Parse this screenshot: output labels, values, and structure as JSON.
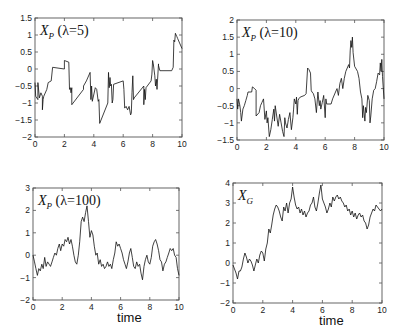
{
  "figure": {
    "width": 407,
    "height": 334,
    "line_color": "#111111",
    "axis_color": "#555555",
    "background": "#ffffff"
  },
  "chart_data": [
    {
      "type": "line",
      "id": "xp-lambda-5",
      "title": "X_P (λ=5)",
      "title_main": "X",
      "title_sub": "P",
      "title_param": " (λ=5)",
      "xlabel": "",
      "ylabel": "",
      "xlim": [
        0,
        10
      ],
      "ylim": [
        -2,
        1.5
      ],
      "xticks": [
        0,
        2,
        4,
        6,
        8,
        10
      ],
      "yticks": [
        -2,
        -1.5,
        -1,
        -0.5,
        0,
        0.5,
        1,
        1.5
      ],
      "grid": false,
      "box": {
        "x0": 35,
        "y0": 18,
        "x1": 182,
        "y1": 137
      },
      "x": [
        0,
        0.05,
        0.2,
        0.2,
        0.3,
        0.4,
        0.5,
        0.5,
        0.55,
        0.6,
        0.8,
        0.9,
        1.1,
        1.2,
        2.0,
        2.0,
        2.3,
        2.35,
        2.4,
        2.45,
        2.5,
        2.5,
        3.3,
        3.3,
        3.5,
        3.75,
        3.8,
        3.85,
        3.9,
        4.1,
        4.2,
        4.3,
        4.35,
        4.4,
        4.95,
        5.0,
        5.05,
        5.1,
        5.15,
        5.2,
        5.25,
        5.3,
        5.35,
        6.0,
        6.05,
        6.1,
        6.2,
        6.3,
        6.4,
        6.5,
        6.55,
        6.6,
        6.65,
        6.7,
        6.75,
        7.4,
        7.4,
        7.45,
        7.5,
        7.55,
        7.9,
        7.95,
        8.0,
        8.05,
        8.15,
        8.2,
        8.25,
        8.3,
        8.4,
        8.4,
        8.5,
        9.3,
        9.4,
        9.45,
        9.5,
        9.55,
        9.6,
        9.65,
        9.7,
        10.0
      ],
      "values": [
        -0.4,
        -0.8,
        -0.9,
        -0.4,
        -0.85,
        -0.7,
        -0.8,
        -1.2,
        -0.9,
        -0.8,
        -0.6,
        -0.4,
        -0.35,
        0.05,
        0.0,
        0.25,
        0.2,
        -0.6,
        -0.55,
        -0.7,
        -0.55,
        -1.05,
        -0.6,
        -0.5,
        -0.35,
        -0.1,
        -0.9,
        -0.5,
        -0.95,
        -0.55,
        -0.6,
        -0.95,
        -0.9,
        -1.6,
        -1.0,
        -0.1,
        -0.55,
        -0.25,
        -0.5,
        -0.45,
        -1.0,
        -0.9,
        -0.45,
        -0.35,
        -0.6,
        -1.15,
        -1.1,
        -1.2,
        -1.1,
        -1.35,
        -1.3,
        -0.7,
        -0.2,
        -0.9,
        -0.85,
        -0.5,
        -1.05,
        -0.6,
        -0.9,
        -0.55,
        -0.35,
        -0.15,
        0.25,
        0.15,
        -0.2,
        -0.5,
        -0.3,
        -0.6,
        0.15,
        0.1,
        -0.05,
        -0.05,
        0.05,
        0.85,
        0.8,
        1.05,
        1.0,
        0.95,
        0.9,
        0.6
      ]
    },
    {
      "type": "line",
      "id": "xp-lambda-10",
      "title": "X_P (λ=10)",
      "title_main": "X",
      "title_sub": "P",
      "title_param": " (λ=10)",
      "xlabel": "",
      "ylabel": "",
      "xlim": [
        0,
        10
      ],
      "ylim": [
        -1.5,
        2
      ],
      "xticks": [
        0,
        2,
        4,
        6,
        8,
        10
      ],
      "yticks": [
        -1.5,
        -1,
        -0.5,
        0,
        0.5,
        1,
        1.5,
        2
      ],
      "grid": false,
      "box": {
        "x0": 237,
        "y0": 20,
        "x1": 384,
        "y1": 140
      },
      "x": [
        0,
        0.05,
        0.1,
        0.2,
        0.25,
        0.3,
        0.4,
        0.5,
        0.6,
        0.7,
        0.75,
        1.0,
        1.05,
        1.2,
        1.3,
        1.3,
        1.5,
        1.6,
        1.7,
        1.8,
        1.9,
        2.0,
        2.05,
        2.1,
        2.2,
        2.3,
        2.4,
        2.5,
        2.55,
        2.6,
        2.7,
        2.8,
        2.9,
        3.0,
        3.1,
        3.2,
        3.25,
        3.3,
        3.4,
        3.5,
        3.6,
        3.7,
        3.8,
        3.85,
        3.9,
        4.0,
        4.05,
        4.1,
        4.15,
        4.2,
        4.3,
        4.6,
        4.7,
        4.8,
        4.9,
        5.0,
        5.05,
        5.1,
        5.2,
        5.3,
        5.4,
        5.5,
        5.6,
        5.65,
        5.7,
        5.8,
        5.9,
        6.0,
        6.05,
        6.1,
        6.4,
        6.5,
        6.7,
        6.8,
        6.9,
        7.0,
        7.1,
        7.2,
        7.3,
        7.4,
        7.6,
        7.65,
        7.7,
        7.75,
        7.8,
        7.85,
        7.9,
        8.0,
        8.2,
        8.3,
        8.4,
        8.5,
        8.55,
        8.6,
        8.7,
        8.75,
        8.8,
        8.9,
        9.0,
        9.05,
        9.1,
        9.2,
        9.3,
        9.4,
        9.5,
        9.6,
        9.7,
        9.75,
        9.8,
        9.85,
        9.9,
        10.0
      ],
      "values": [
        -0.3,
        -0.6,
        -0.3,
        -0.5,
        -0.7,
        -0.95,
        -0.6,
        -0.5,
        -0.35,
        -0.2,
        -0.1,
        -0.1,
        0.05,
        0.0,
        -0.05,
        -0.8,
        -0.7,
        -0.5,
        -0.4,
        -0.3,
        -0.9,
        -0.65,
        -1.0,
        -0.85,
        -1.4,
        -1.2,
        -0.9,
        -0.6,
        -0.95,
        -0.5,
        -0.8,
        -1.1,
        -0.75,
        -1.0,
        -1.25,
        -1.4,
        -0.85,
        -1.0,
        -1.15,
        -0.9,
        -0.7,
        -1.2,
        -0.85,
        -0.6,
        -0.3,
        -0.45,
        -0.25,
        -0.75,
        -0.35,
        -0.3,
        -0.25,
        -0.2,
        -0.15,
        0.6,
        0.55,
        0.45,
        -0.05,
        -0.1,
        -0.15,
        -0.3,
        -0.7,
        -0.1,
        -0.5,
        -0.35,
        -0.6,
        -0.4,
        -0.2,
        -0.85,
        -0.3,
        -0.45,
        -0.45,
        -0.3,
        -0.1,
        0.0,
        -0.2,
        0.15,
        0.3,
        0.0,
        0.3,
        0.5,
        0.7,
        0.6,
        1.1,
        1.4,
        1.2,
        1.5,
        1.05,
        0.65,
        0.5,
        0.3,
        -0.1,
        -0.3,
        -0.85,
        -0.5,
        -0.95,
        -0.55,
        -0.7,
        -0.2,
        -0.35,
        -1.0,
        -0.8,
        -0.3,
        -0.05,
        0.0,
        0.2,
        0.45,
        0.4,
        0.75,
        0.5,
        0.85,
        0.35,
        -0.3
      ]
    },
    {
      "type": "line",
      "id": "xp-lambda-100",
      "title": "X_P (λ=100)",
      "title_main": "X",
      "title_sub": "P",
      "title_param": " (λ=100)",
      "xlabel": "time",
      "ylabel": "",
      "xlim": [
        0,
        10
      ],
      "ylim": [
        -2,
        3
      ],
      "xticks": [
        0,
        2,
        4,
        6,
        8,
        10
      ],
      "yticks": [
        -2,
        -1,
        0,
        1,
        2,
        3
      ],
      "grid": false,
      "box": {
        "x0": 33,
        "y0": 188,
        "x1": 179,
        "y1": 300
      },
      "x": [
        0,
        0.1,
        0.2,
        0.3,
        0.4,
        0.5,
        0.6,
        0.7,
        0.8,
        0.9,
        1.0,
        1.1,
        1.2,
        1.3,
        1.4,
        1.5,
        1.6,
        1.7,
        1.8,
        1.9,
        2.0,
        2.1,
        2.2,
        2.3,
        2.4,
        2.5,
        2.6,
        2.7,
        2.8,
        2.9,
        3.0,
        3.1,
        3.2,
        3.3,
        3.4,
        3.5,
        3.6,
        3.7,
        3.8,
        3.9,
        4.0,
        4.1,
        4.2,
        4.3,
        4.4,
        4.5,
        4.6,
        4.7,
        4.8,
        4.9,
        5.0,
        5.1,
        5.2,
        5.3,
        5.4,
        5.5,
        5.6,
        5.7,
        5.8,
        5.9,
        6.0,
        6.1,
        6.2,
        6.3,
        6.4,
        6.5,
        6.6,
        6.7,
        6.8,
        6.9,
        7.0,
        7.1,
        7.2,
        7.3,
        7.4,
        7.5,
        7.6,
        7.7,
        7.8,
        7.9,
        8.0,
        8.1,
        8.2,
        8.3,
        8.4,
        8.5,
        8.6,
        8.7,
        8.8,
        8.9,
        9.0,
        9.1,
        9.2,
        9.3,
        9.4,
        9.5,
        9.6,
        9.7,
        9.8,
        9.9,
        10.0
      ],
      "values": [
        0.0,
        -0.3,
        -0.6,
        -0.9,
        -0.6,
        -0.7,
        -0.4,
        -0.6,
        -0.1,
        -0.5,
        -0.3,
        -0.4,
        -0.5,
        -0.3,
        -0.1,
        0.1,
        0.0,
        0.3,
        0.5,
        0.2,
        0.5,
        0.4,
        0.7,
        0.6,
        0.8,
        0.5,
        0.7,
        0.4,
        0.0,
        -0.3,
        -0.4,
        0.0,
        0.6,
        1.5,
        1.7,
        1.5,
        1.9,
        2.2,
        1.5,
        0.8,
        1.1,
        0.9,
        0.4,
        0.0,
        0.1,
        -0.4,
        -0.2,
        -0.5,
        -0.4,
        -0.6,
        -0.5,
        -0.3,
        -0.5,
        -0.4,
        -0.6,
        -0.2,
        0.1,
        0.6,
        0.4,
        0.5,
        0.3,
        0.1,
        -0.2,
        -0.4,
        -0.6,
        -0.3,
        0.1,
        0.3,
        -0.1,
        -0.5,
        -0.6,
        -0.3,
        -0.5,
        -0.4,
        -0.8,
        -1.1,
        -0.5,
        -0.2,
        0.0,
        -0.3,
        -0.4,
        -0.1,
        0.4,
        0.6,
        0.7,
        0.5,
        0.2,
        -0.2,
        -0.3,
        -0.7,
        -0.4,
        -0.3,
        -0.1,
        0.1,
        0.3,
        0.2,
        0.3,
        0.0,
        -0.1,
        -0.6,
        -0.9
      ]
    },
    {
      "type": "line",
      "id": "xg",
      "title": "X_G",
      "title_main": "X",
      "title_sub": "G",
      "title_param": "",
      "xlabel": "time",
      "ylabel": "",
      "xlim": [
        0,
        10
      ],
      "ylim": [
        -2,
        4
      ],
      "xticks": [
        0,
        2,
        4,
        6,
        8,
        10
      ],
      "yticks": [
        -2,
        -1,
        0,
        1,
        2,
        3,
        4
      ],
      "grid": false,
      "box": {
        "x0": 233,
        "y0": 183,
        "x1": 382,
        "y1": 303
      },
      "x": [
        0,
        0.1,
        0.2,
        0.3,
        0.4,
        0.5,
        0.6,
        0.7,
        0.8,
        0.9,
        1.0,
        1.1,
        1.2,
        1.3,
        1.4,
        1.5,
        1.6,
        1.7,
        1.8,
        1.9,
        2.0,
        2.1,
        2.2,
        2.3,
        2.4,
        2.5,
        2.6,
        2.7,
        2.8,
        2.9,
        3.0,
        3.1,
        3.2,
        3.3,
        3.4,
        3.5,
        3.6,
        3.7,
        3.8,
        3.9,
        4.0,
        4.1,
        4.2,
        4.3,
        4.4,
        4.5,
        4.6,
        4.7,
        4.8,
        4.9,
        5.0,
        5.1,
        5.2,
        5.3,
        5.4,
        5.5,
        5.6,
        5.7,
        5.8,
        5.9,
        6.0,
        6.1,
        6.2,
        6.3,
        6.4,
        6.5,
        6.6,
        6.7,
        6.8,
        6.9,
        7.0,
        7.1,
        7.2,
        7.3,
        7.4,
        7.5,
        7.6,
        7.7,
        7.8,
        7.9,
        8.0,
        8.1,
        8.2,
        8.3,
        8.4,
        8.5,
        8.6,
        8.7,
        8.8,
        8.9,
        9.0,
        9.1,
        9.2,
        9.3,
        9.4,
        9.5,
        9.6,
        9.7,
        9.8,
        9.9,
        10.0
      ],
      "values": [
        -0.1,
        -0.3,
        -0.5,
        -0.8,
        -0.4,
        -0.4,
        -0.2,
        0.2,
        0.5,
        0.3,
        0.0,
        0.2,
        0.1,
        -0.1,
        -0.4,
        -0.1,
        0.2,
        0.0,
        0.4,
        0.6,
        0.5,
        0.1,
        0.7,
        1.0,
        1.7,
        1.5,
        1.9,
        2.4,
        2.7,
        2.9,
        2.8,
        2.6,
        2.3,
        2.1,
        2.8,
        2.6,
        3.0,
        2.5,
        3.0,
        3.2,
        3.8,
        3.3,
        2.9,
        2.7,
        2.8,
        2.5,
        2.7,
        2.4,
        2.6,
        2.3,
        2.5,
        2.6,
        2.9,
        3.0,
        3.3,
        2.8,
        2.6,
        3.0,
        3.5,
        3.9,
        3.2,
        3.0,
        2.8,
        2.5,
        2.7,
        3.0,
        2.8,
        3.3,
        3.1,
        3.3,
        3.4,
        3.2,
        3.3,
        3.1,
        3.0,
        2.8,
        2.9,
        2.6,
        2.7,
        2.4,
        2.6,
        2.3,
        2.5,
        2.2,
        2.4,
        2.5,
        2.3,
        2.4,
        2.1,
        2.0,
        1.7,
        1.9,
        2.3,
        2.5,
        2.7,
        2.6,
        2.9,
        2.8,
        2.7,
        2.6,
        2.7
      ]
    }
  ]
}
